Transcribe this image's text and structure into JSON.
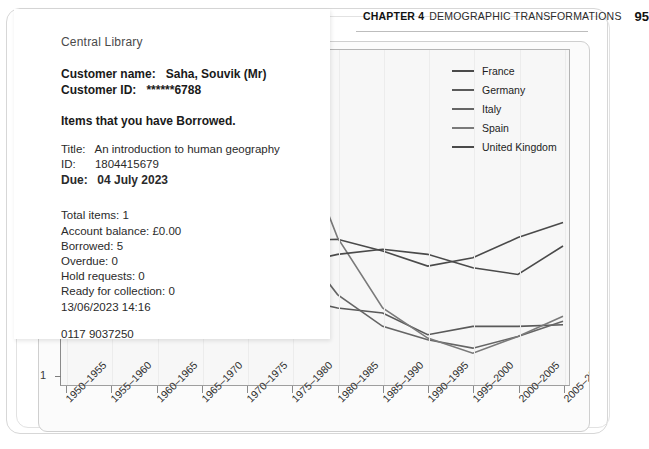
{
  "page": {
    "running_head": {
      "chapter": "CHAPTER 4",
      "title": "DEMOGRAPHIC TRANSFORMATIONS",
      "page_number": "95"
    }
  },
  "receipt": {
    "branch": "Central Library",
    "customer_name_label": "Customer name:",
    "customer_name_value": "Saha, Souvik (Mr)",
    "customer_id_label": "Customer ID:",
    "customer_id_value": "******6788",
    "section_heading": "Items that you have Borrowed.",
    "item": {
      "title_label": "Title:",
      "title_value": "An introduction to human geography",
      "id_label": "ID:",
      "id_value": "1804415679",
      "due_label": "Due:",
      "due_value": "04 July 2023"
    },
    "summary": [
      {
        "label": "Total items:",
        "value": "1"
      },
      {
        "label": "Account balance:",
        "value": "£0.00"
      },
      {
        "label": "Borrowed:",
        "value": "5"
      },
      {
        "label": "Overdue:",
        "value": "0"
      },
      {
        "label": "Hold requests:",
        "value": "0"
      },
      {
        "label": "Ready for collection:",
        "value": "0"
      }
    ],
    "printed_at": "13/06/2023 14:16",
    "phone": "0117 9037250",
    "website": "www.bristol.gov.uk/libraries"
  },
  "chart_data": {
    "type": "line",
    "title": "",
    "xlabel": "",
    "ylabel": "Total fertility rate (children per woman)",
    "ylabel_visible_text": "Total fertility rate (child...",
    "grid": true,
    "legend_position": "top-right",
    "ylim": [
      1,
      3
    ],
    "yticks": [
      "1"
    ],
    "categories": [
      "1950–1955",
      "1955–1960",
      "1960–1965",
      "1965–1970",
      "1970–1975",
      "1975–1980",
      "1980–1985",
      "1985–1990",
      "1990–1995",
      "1995–2000",
      "2000–2005",
      "2005–2010"
    ],
    "series": [
      {
        "name": "France",
        "color": "#4a4a4a",
        "values": [
          2.73,
          2.71,
          2.85,
          2.65,
          2.31,
          1.86,
          1.87,
          1.8,
          1.71,
          1.76,
          1.88,
          1.97
        ]
      },
      {
        "name": "Germany",
        "color": "#5a5a5a",
        "values": [
          2.16,
          2.3,
          2.49,
          2.32,
          1.64,
          1.52,
          1.46,
          1.43,
          1.3,
          1.35,
          1.35,
          1.36
        ]
      },
      {
        "name": "Italy",
        "color": "#656565",
        "values": [
          2.36,
          2.35,
          2.55,
          2.49,
          2.33,
          1.89,
          1.54,
          1.35,
          1.27,
          1.22,
          1.29,
          1.38
        ]
      },
      {
        "name": "Spain",
        "color": "#7a7a7a",
        "values": [
          2.57,
          2.75,
          2.89,
          2.9,
          2.86,
          2.57,
          1.88,
          1.46,
          1.28,
          1.19,
          1.29,
          1.41
        ]
      },
      {
        "name": "United Kingdom",
        "color": "#4a4a4a",
        "values": [
          2.18,
          2.49,
          2.81,
          2.52,
          2.04,
          1.72,
          1.78,
          1.81,
          1.78,
          1.7,
          1.66,
          1.83
        ]
      }
    ]
  }
}
